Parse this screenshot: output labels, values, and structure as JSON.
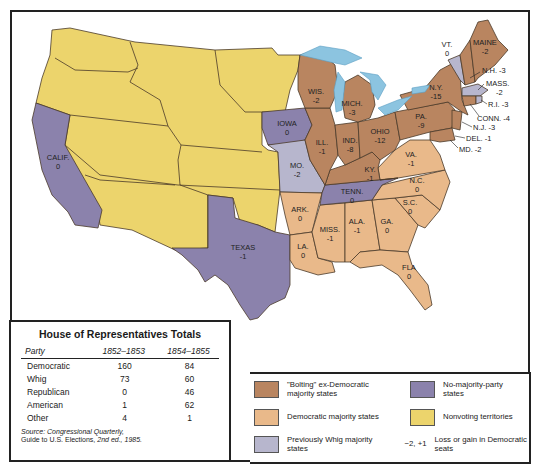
{
  "map": {
    "colors": {
      "bolting": "#b98560",
      "democratic": "#e9b98a",
      "whig": "#b7b6cd",
      "no_majority": "#8b82ac",
      "nonvoting": "#ecd46c",
      "water": "#8cc4e0",
      "border": "#4a3a2a"
    },
    "states": [
      {
        "name": "MAINE",
        "change": "-2",
        "category": "bolting"
      },
      {
        "name": "VT.",
        "change": "0",
        "category": "whig"
      },
      {
        "name": "N.H.",
        "change": "-3",
        "category": "bolting"
      },
      {
        "name": "MASS.",
        "change": "-2",
        "category": "whig"
      },
      {
        "name": "R.I.",
        "change": "-3",
        "category": "bolting"
      },
      {
        "name": "CONN.",
        "change": "-4",
        "category": "bolting"
      },
      {
        "name": "N.Y.",
        "change": "-15",
        "category": "bolting"
      },
      {
        "name": "N.J.",
        "change": "-3",
        "category": "bolting"
      },
      {
        "name": "PA.",
        "change": "-9",
        "category": "bolting"
      },
      {
        "name": "DEL.",
        "change": "-1",
        "category": "bolting"
      },
      {
        "name": "MD.",
        "change": "-2",
        "category": "bolting"
      },
      {
        "name": "OHIO",
        "change": "-12",
        "category": "bolting"
      },
      {
        "name": "MICH.",
        "change": "-3",
        "category": "bolting"
      },
      {
        "name": "IND.",
        "change": "-8",
        "category": "bolting"
      },
      {
        "name": "ILL.",
        "change": "-1",
        "category": "bolting"
      },
      {
        "name": "WIS.",
        "change": "-2",
        "category": "bolting"
      },
      {
        "name": "KY.",
        "change": "-1",
        "category": "bolting"
      },
      {
        "name": "IOWA",
        "change": "0",
        "category": "no_majority"
      },
      {
        "name": "MO.",
        "change": "-2",
        "category": "whig"
      },
      {
        "name": "VA.",
        "change": "-1",
        "category": "democratic"
      },
      {
        "name": "N.C.",
        "change": "0",
        "category": "democratic"
      },
      {
        "name": "S.C.",
        "change": "0",
        "category": "democratic"
      },
      {
        "name": "GA.",
        "change": "0",
        "category": "democratic"
      },
      {
        "name": "FLA",
        "change": "0",
        "category": "democratic"
      },
      {
        "name": "ALA.",
        "change": "-1",
        "category": "democratic"
      },
      {
        "name": "MISS.",
        "change": "-1",
        "category": "democratic"
      },
      {
        "name": "LA.",
        "change": "0",
        "category": "democratic"
      },
      {
        "name": "ARK.",
        "change": "0",
        "category": "democratic"
      },
      {
        "name": "TENN.",
        "change": "0",
        "category": "no_majority"
      },
      {
        "name": "TEXAS",
        "change": "-1",
        "category": "no_majority"
      },
      {
        "name": "CALIF.",
        "change": "0",
        "category": "no_majority"
      }
    ]
  },
  "table": {
    "title": "House of Representatives Totals",
    "headers": [
      "Party",
      "1852–1853",
      "1854–1855"
    ],
    "rows": [
      {
        "party": "Democratic",
        "y1852": "160",
        "y1854": "84"
      },
      {
        "party": "Whig",
        "y1852": "73",
        "y1854": "60"
      },
      {
        "party": "Republican",
        "y1852": "0",
        "y1854": "46"
      },
      {
        "party": "American",
        "y1852": "1",
        "y1854": "62"
      },
      {
        "party": "Other",
        "y1852": "4",
        "y1854": "1"
      }
    ],
    "source_line1": "Source: Congressional Quarterly,",
    "source_line2_a": "Guide to U.S. Elections, ",
    "source_line2_b": "2nd ed., 1985."
  },
  "legend": {
    "items": [
      {
        "label": "\"Bolting\" ex-Democratic majority states",
        "color": "#b98560"
      },
      {
        "label": "Democratic majority states",
        "color": "#e9b98a"
      },
      {
        "label": "Previously Whig majority states",
        "color": "#b7b6cd"
      },
      {
        "label": "No-majority-party states",
        "color": "#8b82ac"
      },
      {
        "label": "Nonvoting territories",
        "color": "#ecd46c"
      }
    ],
    "delta_example": "−2, +1",
    "delta_label": "Loss or gain in Democratic seats"
  }
}
